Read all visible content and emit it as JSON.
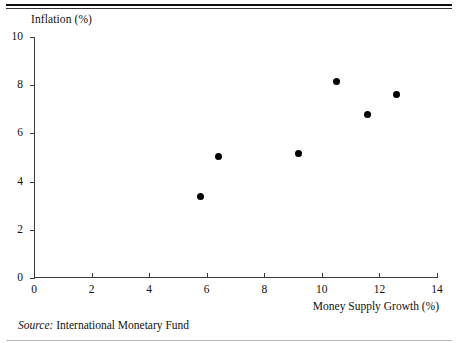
{
  "figure": {
    "y_axis_title": "Inflation (%)",
    "x_axis_title": "Money Supply Growth (%)",
    "source_label": "Source:",
    "source_text": "International Monetary Fund"
  },
  "chart_data": {
    "type": "scatter",
    "title": "",
    "xlabel": "Money Supply Growth (%)",
    "ylabel": "Inflation (%)",
    "xlim": [
      0,
      14
    ],
    "ylim": [
      0,
      10
    ],
    "xticks": [
      0,
      2,
      4,
      6,
      8,
      10,
      12,
      14
    ],
    "yticks": [
      0,
      2,
      4,
      6,
      8,
      10
    ],
    "grid": false,
    "legend": false,
    "marker": "filled-circle",
    "marker_color": "#000000",
    "points": [
      {
        "x": 5.8,
        "y": 3.4
      },
      {
        "x": 6.4,
        "y": 5.05
      },
      {
        "x": 9.2,
        "y": 5.15
      },
      {
        "x": 10.5,
        "y": 8.15
      },
      {
        "x": 11.6,
        "y": 6.8
      },
      {
        "x": 12.6,
        "y": 7.6
      }
    ]
  }
}
